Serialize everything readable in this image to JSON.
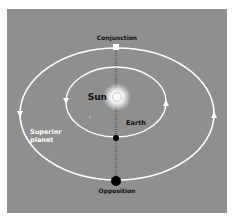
{
  "diagram": {
    "labels": {
      "conjunction": "Conjunction",
      "sun": "Sun",
      "earth": "Earth",
      "superior_planet_line1": "Superior",
      "superior_planet_line2": "planet",
      "opposition": "Opposition"
    },
    "colors": {
      "background": "#8f8f8f",
      "orbit": "#ffffff",
      "planet_at_conjunction": "#ffffff",
      "planet_at_opposition": "#000000",
      "earth": "#000000",
      "sun_glow": "#ffffff",
      "axis_line": "#222222"
    },
    "orbits": [
      {
        "name": "superior-planet-orbit",
        "direction": "counter-clockwise"
      },
      {
        "name": "earth-orbit",
        "direction": "counter-clockwise"
      }
    ]
  }
}
